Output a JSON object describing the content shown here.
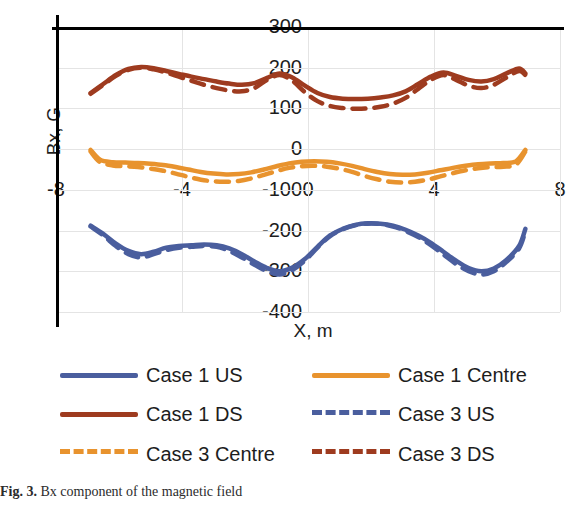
{
  "chart_data": {
    "type": "line",
    "title": "",
    "xlabel": "X, m",
    "ylabel": "Bx, G",
    "xlim": [
      -8,
      8
    ],
    "ylim": [
      -400,
      300
    ],
    "xticks": [
      "-8",
      "-4",
      "0",
      "4",
      "8"
    ],
    "xtick_values": [
      -8,
      -4,
      0,
      4,
      8
    ],
    "yticks": [
      "300",
      "200",
      "100",
      "0",
      "-100",
      "-200",
      "-300",
      "-400"
    ],
    "ytick_values": [
      300,
      200,
      100,
      0,
      -100,
      -200,
      -300,
      -400
    ],
    "grid": true,
    "legend_position": "below",
    "colors": {
      "us": "#4A5E9E",
      "centre": "#E8932E",
      "ds": "#9E3B1F"
    },
    "series": [
      {
        "name": "Case 1 US",
        "color": "#4A5E9E",
        "style": "solid",
        "x": [
          -6.9,
          -6.5,
          -6.1,
          -5.7,
          -5.3,
          -4.9,
          -4.5,
          -4.1,
          -3.7,
          -3.3,
          -2.9,
          -2.5,
          -2.1,
          -1.7,
          -1.3,
          -0.9,
          -0.5,
          -0.1,
          0.3,
          0.7,
          1.1,
          1.5,
          1.9,
          2.3,
          2.7,
          3.1,
          3.5,
          3.9,
          4.3,
          4.7,
          5.1,
          5.5,
          5.9,
          6.3,
          6.7,
          6.9
        ],
        "y": [
          -188,
          -208,
          -232,
          -250,
          -258,
          -252,
          -242,
          -238,
          -236,
          -234,
          -236,
          -244,
          -258,
          -276,
          -292,
          -300,
          -291,
          -270,
          -240,
          -212,
          -196,
          -186,
          -182,
          -183,
          -188,
          -198,
          -212,
          -230,
          -252,
          -274,
          -292,
          -300,
          -293,
          -272,
          -238,
          -196
        ]
      },
      {
        "name": "Case 1 Centre",
        "color": "#E8932E",
        "style": "solid",
        "x": [
          -6.9,
          -6.6,
          -6.2,
          -5.8,
          -5.4,
          -5.0,
          -4.6,
          -4.2,
          -3.8,
          -3.4,
          -3.0,
          -2.6,
          -2.2,
          -1.8,
          -1.4,
          -1.0,
          -0.6,
          -0.2,
          0.2,
          0.6,
          1.0,
          1.4,
          1.8,
          2.2,
          2.6,
          3.0,
          3.4,
          3.8,
          4.2,
          4.6,
          5.0,
          5.4,
          5.8,
          6.2,
          6.6,
          6.9
        ],
        "y": [
          -2,
          -26,
          -32,
          -33,
          -34,
          -36,
          -39,
          -44,
          -50,
          -56,
          -60,
          -62,
          -61,
          -57,
          -50,
          -42,
          -35,
          -31,
          -30,
          -31,
          -35,
          -41,
          -49,
          -56,
          -61,
          -63,
          -62,
          -58,
          -52,
          -46,
          -41,
          -37,
          -35,
          -34,
          -30,
          -2
        ]
      },
      {
        "name": "Case 1 DS",
        "color": "#9E3B1F",
        "style": "solid",
        "x": [
          -6.9,
          -6.5,
          -6.1,
          -5.7,
          -5.3,
          -4.9,
          -4.5,
          -4.1,
          -3.7,
          -3.3,
          -2.9,
          -2.5,
          -2.1,
          -1.7,
          -1.3,
          -0.9,
          -0.5,
          -0.1,
          0.3,
          0.7,
          1.1,
          1.5,
          1.9,
          2.3,
          2.7,
          3.1,
          3.5,
          3.9,
          4.3,
          4.7,
          5.1,
          5.5,
          5.9,
          6.3,
          6.7,
          6.9
        ],
        "y": [
          138,
          160,
          182,
          197,
          202,
          199,
          192,
          185,
          178,
          172,
          166,
          161,
          158,
          162,
          175,
          186,
          176,
          156,
          138,
          128,
          124,
          123,
          124,
          127,
          132,
          142,
          160,
          178,
          188,
          180,
          170,
          166,
          172,
          186,
          198,
          186
        ]
      },
      {
        "name": "Case 3 US",
        "color": "#4A5E9E",
        "style": "dashed",
        "x": [
          -6.9,
          -6.5,
          -6.1,
          -5.7,
          -5.3,
          -4.9,
          -4.5,
          -4.1,
          -3.7,
          -3.3,
          -2.9,
          -2.5,
          -2.1,
          -1.7,
          -1.3,
          -0.9,
          -0.5,
          -0.1,
          0.3,
          0.7,
          1.1,
          1.5,
          1.9,
          2.3,
          2.7,
          3.1,
          3.5,
          3.9,
          4.3,
          4.7,
          5.1,
          5.5,
          5.9,
          6.3,
          6.7,
          6.9
        ],
        "y": [
          -190,
          -212,
          -238,
          -258,
          -266,
          -258,
          -248,
          -242,
          -240,
          -238,
          -240,
          -250,
          -266,
          -284,
          -300,
          -308,
          -297,
          -274,
          -242,
          -214,
          -197,
          -187,
          -183,
          -184,
          -190,
          -201,
          -216,
          -236,
          -259,
          -282,
          -300,
          -308,
          -300,
          -277,
          -244,
          -202
        ]
      },
      {
        "name": "Case 3 Centre",
        "color": "#E8932E",
        "style": "dashed",
        "x": [
          -6.9,
          -6.6,
          -6.2,
          -5.8,
          -5.4,
          -5.0,
          -4.6,
          -4.2,
          -3.8,
          -3.4,
          -3.0,
          -2.6,
          -2.2,
          -1.8,
          -1.4,
          -1.0,
          -0.6,
          -0.2,
          0.2,
          0.6,
          1.0,
          1.4,
          1.8,
          2.2,
          2.6,
          3.0,
          3.4,
          3.8,
          4.2,
          4.6,
          5.0,
          5.4,
          5.8,
          6.2,
          6.6,
          6.9
        ],
        "y": [
          -6,
          -32,
          -40,
          -42,
          -44,
          -48,
          -53,
          -60,
          -68,
          -75,
          -79,
          -80,
          -78,
          -72,
          -63,
          -54,
          -46,
          -42,
          -41,
          -43,
          -48,
          -56,
          -66,
          -74,
          -80,
          -82,
          -80,
          -75,
          -67,
          -59,
          -52,
          -47,
          -44,
          -43,
          -38,
          -6
        ]
      },
      {
        "name": "Case 3 DS",
        "color": "#9E3B1F",
        "style": "dashed",
        "x": [
          -6.9,
          -6.5,
          -6.1,
          -5.7,
          -5.3,
          -4.9,
          -4.5,
          -4.1,
          -3.7,
          -3.3,
          -2.9,
          -2.5,
          -2.1,
          -1.7,
          -1.3,
          -0.9,
          -0.5,
          -0.1,
          0.3,
          0.7,
          1.1,
          1.5,
          1.9,
          2.3,
          2.7,
          3.1,
          3.5,
          3.9,
          4.3,
          4.7,
          5.1,
          5.5,
          5.9,
          6.3,
          6.7,
          6.9
        ],
        "y": [
          136,
          158,
          180,
          195,
          200,
          196,
          188,
          178,
          168,
          158,
          150,
          144,
          142,
          150,
          170,
          182,
          168,
          140,
          118,
          106,
          101,
          99,
          100,
          104,
          112,
          126,
          148,
          170,
          182,
          170,
          156,
          150,
          158,
          176,
          192,
          182
        ]
      }
    ]
  },
  "axes": {
    "ylabel": "Bx, G",
    "xlabel": "X, m",
    "yticks": [
      "300",
      "200",
      "100",
      "0",
      "-100",
      "-200",
      "-300",
      "-400"
    ],
    "xticks": [
      "-8",
      "-4",
      "0",
      "4",
      "8"
    ]
  },
  "legend": {
    "items": [
      {
        "label": "Case 1 US",
        "color": "#4A5E9E",
        "style": "solid"
      },
      {
        "label": "Case 1 Centre",
        "color": "#E8932E",
        "style": "solid"
      },
      {
        "label": "Case 1 DS",
        "color": "#9E3B1F",
        "style": "solid"
      },
      {
        "label": "Case 3 US",
        "color": "#4A5E9E",
        "style": "dashed"
      },
      {
        "label": "Case 3 Centre",
        "color": "#E8932E",
        "style": "dashed"
      },
      {
        "label": "Case 3 DS",
        "color": "#9E3B1F",
        "style": "dashed"
      }
    ]
  },
  "caption": {
    "number": "Fig. 3.",
    "text": "Bx component of the magnetic field"
  }
}
